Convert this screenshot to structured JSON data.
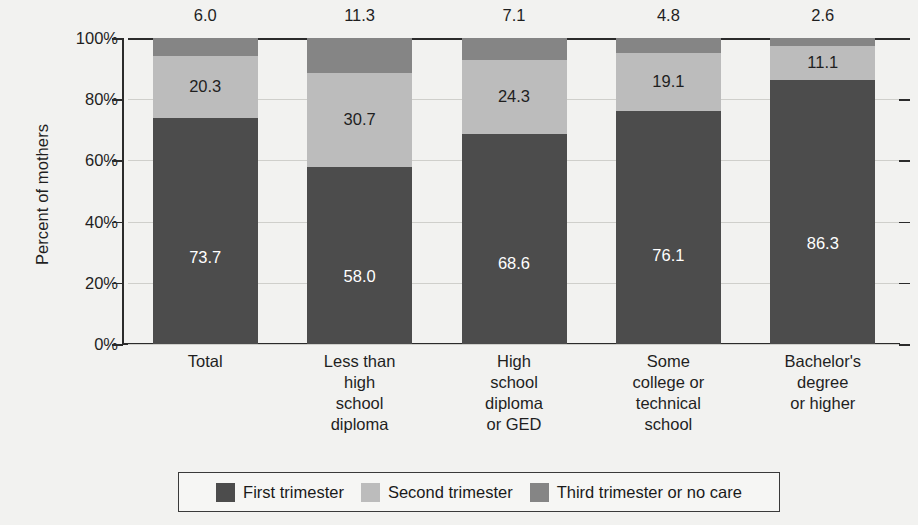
{
  "chart_data": {
    "type": "bar",
    "stacked": true,
    "title": "",
    "xlabel": "",
    "ylabel": "Percent of mothers",
    "ylim": [
      0,
      100
    ],
    "ytick_labels": [
      "0%",
      "20%",
      "40%",
      "60%",
      "80%",
      "100%"
    ],
    "ytick_values": [
      0,
      20,
      40,
      60,
      80,
      100
    ],
    "grid": true,
    "legend_position": "bottom",
    "categories": [
      "Total",
      "Less than\nhigh\nschool\ndiploma",
      "High\nschool\ndiploma\nor GED",
      "Some\ncollege or\ntechnical\nschool",
      "Bachelor's\ndegree\nor higher"
    ],
    "series": [
      {
        "name": "First trimester",
        "color": "#4c4c4c",
        "values": [
          73.7,
          58.0,
          68.6,
          76.1,
          86.3
        ],
        "labels": [
          "73.7",
          "58.0",
          "68.6",
          "76.1",
          "86.3"
        ]
      },
      {
        "name": "Second trimester",
        "color": "#bcbcbc",
        "values": [
          20.3,
          30.7,
          24.3,
          19.1,
          11.1
        ],
        "labels": [
          "20.3",
          "30.7",
          "24.3",
          "19.1",
          "11.1"
        ]
      },
      {
        "name": "Third trimester or no care",
        "color": "#858585",
        "values": [
          6.0,
          11.3,
          7.1,
          4.8,
          2.6
        ],
        "labels": [
          "6.0",
          "11.3",
          "7.1",
          "4.8",
          "2.6"
        ]
      }
    ],
    "top_annotations": [
      "6.0",
      "11.3",
      "7.1",
      "4.8",
      "2.6"
    ]
  },
  "axis": {
    "y_title": "Percent of mothers"
  },
  "legend": {
    "items": [
      {
        "label": "First trimester",
        "color": "#4c4c4c"
      },
      {
        "label": "Second trimester",
        "color": "#bcbcbc"
      },
      {
        "label": "Third trimester or no care",
        "color": "#858585"
      }
    ]
  }
}
